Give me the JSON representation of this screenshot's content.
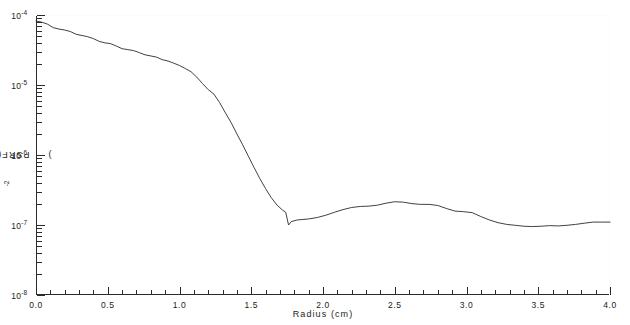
{
  "chart_data": {
    "type": "line",
    "title": "",
    "xlabel": "Radius  (cm)",
    "ylabel": "PSRF(r)  (cm⁻²)",
    "ylabel_base": "PSRF(r)  (cm",
    "ylabel_exp": "-2",
    "ylabel_close": ")",
    "xscale": "linear",
    "yscale": "log",
    "xlim": [
      0.0,
      4.0
    ],
    "ylim": [
      1e-08,
      0.0001
    ],
    "grid": false,
    "legend": null,
    "xticks": [
      0.0,
      0.5,
      1.0,
      1.5,
      2.0,
      2.5,
      3.0,
      3.5,
      4.0
    ],
    "xticklabels": [
      "0.0",
      "0.5",
      "1.0",
      "1.5",
      "2.0",
      "2.5",
      "3.0",
      "3.5",
      "4.0"
    ],
    "x_minor_step": 0.1,
    "yticks": [
      0.0001,
      1e-05,
      1e-06,
      1e-07,
      1e-08
    ],
    "yticklabels_mantissa": [
      "10",
      "10",
      "10",
      "10",
      "10"
    ],
    "yticklabels_exp": [
      "-4",
      "-5",
      "-6",
      "-7",
      "-8"
    ],
    "series": [
      {
        "name": "PSRF(r)",
        "color": "#2b2b2b",
        "linewidth": 0.9,
        "x": [
          0.0,
          0.04,
          0.08,
          0.12,
          0.16,
          0.2,
          0.24,
          0.28,
          0.32,
          0.36,
          0.4,
          0.44,
          0.48,
          0.52,
          0.56,
          0.6,
          0.64,
          0.68,
          0.72,
          0.76,
          0.8,
          0.84,
          0.88,
          0.92,
          0.96,
          1.0,
          1.04,
          1.08,
          1.12,
          1.16,
          1.2,
          1.24,
          1.28,
          1.32,
          1.36,
          1.4,
          1.44,
          1.48,
          1.52,
          1.56,
          1.6,
          1.64,
          1.68,
          1.72,
          1.74,
          1.76,
          1.78,
          1.82,
          1.86,
          1.9,
          1.96,
          2.02,
          2.08,
          2.14,
          2.2,
          2.26,
          2.32,
          2.38,
          2.44,
          2.5,
          2.56,
          2.62,
          2.68,
          2.74,
          2.8,
          2.86,
          2.92,
          2.98,
          3.04,
          3.1,
          3.16,
          3.22,
          3.28,
          3.34,
          3.4,
          3.46,
          3.52,
          3.58,
          3.64,
          3.7,
          3.76,
          3.82,
          3.88,
          3.94,
          4.0
        ],
        "y": [
          8.2e-05,
          7.9e-05,
          7.4e-05,
          6.6e-05,
          6.3e-05,
          6.1e-05,
          5.8e-05,
          5.3e-05,
          5.1e-05,
          4.9e-05,
          4.6e-05,
          4.2e-05,
          4e-05,
          3.9e-05,
          3.6e-05,
          3.3e-05,
          3.2e-05,
          3.1e-05,
          2.9e-05,
          2.7e-05,
          2.6e-05,
          2.5e-05,
          2.3e-05,
          2.2e-05,
          2.05e-05,
          1.9e-05,
          1.72e-05,
          1.55e-05,
          1.3e-05,
          1.05e-05,
          8.6e-06,
          7.4e-06,
          5.6e-06,
          4e-06,
          2.9e-06,
          2e-06,
          1.4e-06,
          9.6e-07,
          6.6e-07,
          4.6e-07,
          3.3e-07,
          2.45e-07,
          1.92e-07,
          1.62e-07,
          1.52e-07,
          1e-07,
          1.12e-07,
          1.18e-07,
          1.2e-07,
          1.22e-07,
          1.28e-07,
          1.38e-07,
          1.52e-07,
          1.66e-07,
          1.78e-07,
          1.84e-07,
          1.86e-07,
          1.92e-07,
          2.05e-07,
          2.15e-07,
          2.12e-07,
          2.02e-07,
          1.97e-07,
          1.97e-07,
          1.9e-07,
          1.72e-07,
          1.58e-07,
          1.55e-07,
          1.5e-07,
          1.32e-07,
          1.18e-07,
          1.08e-07,
          1.02e-07,
          9.9e-08,
          9.6e-08,
          9.5e-08,
          9.6e-08,
          9.8e-08,
          9.7e-08,
          9.9e-08,
          1.02e-07,
          1.06e-07,
          1.1e-07,
          1.1e-07,
          1.1e-07
        ]
      }
    ]
  }
}
